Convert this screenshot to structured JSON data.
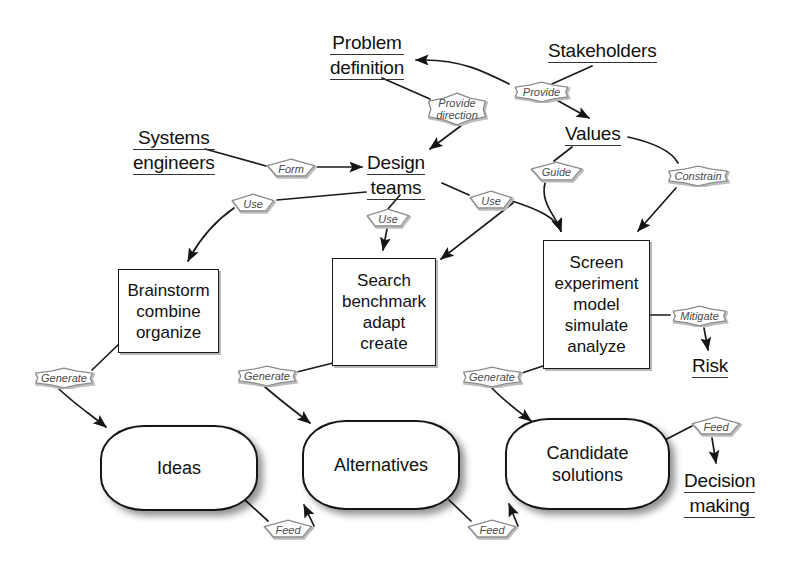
{
  "diagram": {
    "background": "#ffffff",
    "ink": "#111111",
    "cloud_text_color": "#4a4a4a"
  },
  "concepts": [
    {
      "id": "problem-definition",
      "lines": [
        "Problem",
        "definition"
      ],
      "x": 330,
      "y": 32
    },
    {
      "id": "stakeholders",
      "lines": [
        "Stakeholders"
      ],
      "x": 548,
      "y": 40
    },
    {
      "id": "values",
      "lines": [
        "Values"
      ],
      "x": 565,
      "y": 123
    },
    {
      "id": "systems-engineers",
      "lines": [
        "Systems",
        "engineers"
      ],
      "x": 133,
      "y": 127
    },
    {
      "id": "design-teams",
      "lines": [
        "Design",
        "teams"
      ],
      "x": 367,
      "y": 152
    },
    {
      "id": "risk",
      "lines": [
        "Risk"
      ],
      "x": 692,
      "y": 355
    },
    {
      "id": "decision-making",
      "lines": [
        "Decision",
        "making"
      ],
      "x": 684,
      "y": 470
    }
  ],
  "process_boxes": [
    {
      "id": "brainstorm",
      "lines": [
        "Brainstorm",
        "combine",
        "organize"
      ],
      "x": 118,
      "y": 269,
      "w": 101,
      "h": 84
    },
    {
      "id": "search",
      "lines": [
        "Search",
        "benchmark",
        "adapt",
        "create"
      ],
      "x": 332,
      "y": 258,
      "w": 104,
      "h": 108
    },
    {
      "id": "screen",
      "lines": [
        "Screen",
        "experiment",
        "model",
        "simulate",
        "analyze"
      ],
      "x": 543,
      "y": 240,
      "w": 107,
      "h": 129
    }
  ],
  "stores": [
    {
      "id": "ideas",
      "lines": [
        "Ideas"
      ],
      "x": 100,
      "y": 425,
      "w": 158,
      "h": 86
    },
    {
      "id": "alternatives",
      "lines": [
        "Alternatives"
      ],
      "x": 302,
      "y": 420,
      "w": 158,
      "h": 90
    },
    {
      "id": "candidate-solutions",
      "lines": [
        "Candidate",
        "solutions"
      ],
      "x": 505,
      "y": 418,
      "w": 165,
      "h": 92
    }
  ],
  "relations": [
    {
      "id": "provide",
      "lines": [
        "Provide"
      ],
      "x": 510,
      "y": 81,
      "w": 63,
      "h": 22
    },
    {
      "id": "provide-direction",
      "lines": [
        "Provide",
        "direction"
      ],
      "x": 423,
      "y": 92,
      "w": 68,
      "h": 34
    },
    {
      "id": "form",
      "lines": [
        "Form"
      ],
      "x": 265,
      "y": 158,
      "w": 52,
      "h": 21
    },
    {
      "id": "guide",
      "lines": [
        "Guide"
      ],
      "x": 529,
      "y": 161,
      "w": 55,
      "h": 22
    },
    {
      "id": "constrain",
      "lines": [
        "Constrain"
      ],
      "x": 663,
      "y": 165,
      "w": 70,
      "h": 22
    },
    {
      "id": "use-brainstorm",
      "lines": [
        "Use"
      ],
      "x": 230,
      "y": 193,
      "w": 46,
      "h": 21
    },
    {
      "id": "use-search",
      "lines": [
        "Use"
      ],
      "x": 365,
      "y": 208,
      "w": 46,
      "h": 21
    },
    {
      "id": "use-screen",
      "lines": [
        "Use"
      ],
      "x": 468,
      "y": 190,
      "w": 46,
      "h": 21
    },
    {
      "id": "mitigate",
      "lines": [
        "Mitigate"
      ],
      "x": 668,
      "y": 305,
      "w": 63,
      "h": 22
    },
    {
      "id": "generate-ideas",
      "lines": [
        "Generate"
      ],
      "x": 30,
      "y": 367,
      "w": 68,
      "h": 22
    },
    {
      "id": "generate-alternatives",
      "lines": [
        "Generate"
      ],
      "x": 233,
      "y": 365,
      "w": 68,
      "h": 22
    },
    {
      "id": "generate-candidates",
      "lines": [
        "Generate"
      ],
      "x": 458,
      "y": 366,
      "w": 68,
      "h": 22
    },
    {
      "id": "feed-alternatives",
      "lines": [
        "Feed"
      ],
      "x": 262,
      "y": 519,
      "w": 52,
      "h": 21
    },
    {
      "id": "feed-candidates",
      "lines": [
        "Feed"
      ],
      "x": 466,
      "y": 519,
      "w": 52,
      "h": 21
    },
    {
      "id": "feed-decision",
      "lines": [
        "Feed"
      ],
      "x": 690,
      "y": 416,
      "w": 52,
      "h": 21
    }
  ],
  "edges": [
    {
      "id": "stakeholders-provide",
      "from": "stakeholders",
      "to": "provide"
    },
    {
      "id": "provide-problem-definition",
      "from": "provide",
      "to": "problem-definition",
      "arrow": true
    },
    {
      "id": "provide-values",
      "from": "provide",
      "to": "values",
      "arrow": true
    },
    {
      "id": "problem-definition-direction",
      "from": "problem-definition",
      "to": "provide-direction"
    },
    {
      "id": "direction-design-teams",
      "from": "provide-direction",
      "to": "design-teams",
      "arrow": true
    },
    {
      "id": "systems-engineers-form",
      "from": "systems-engineers",
      "to": "form"
    },
    {
      "id": "form-design-teams",
      "from": "form",
      "to": "design-teams",
      "arrow": true
    },
    {
      "id": "design-teams-use-brainstorm",
      "from": "design-teams",
      "to": "use-brainstorm"
    },
    {
      "id": "use-brainstorm-box",
      "from": "use-brainstorm",
      "to": "brainstorm",
      "arrow": true
    },
    {
      "id": "design-teams-use-search",
      "from": "design-teams",
      "to": "use-search"
    },
    {
      "id": "use-search-box",
      "from": "use-search",
      "to": "search",
      "arrow": true
    },
    {
      "id": "design-teams-use-screen",
      "from": "design-teams",
      "to": "use-screen"
    },
    {
      "id": "use-screen-box",
      "from": "use-screen",
      "to": "screen",
      "arrow": true
    },
    {
      "id": "use-screen-search-box",
      "from": "use-screen",
      "to": "search",
      "arrow": true
    },
    {
      "id": "values-guide",
      "from": "values",
      "to": "guide"
    },
    {
      "id": "guide-screen",
      "from": "guide",
      "to": "screen",
      "arrow": true
    },
    {
      "id": "values-constrain",
      "from": "values",
      "to": "constrain"
    },
    {
      "id": "constrain-screen",
      "from": "constrain",
      "to": "screen",
      "arrow": true
    },
    {
      "id": "brainstorm-generate",
      "from": "brainstorm",
      "to": "generate-ideas"
    },
    {
      "id": "generate-ideas-store",
      "from": "generate-ideas",
      "to": "ideas",
      "arrow": true
    },
    {
      "id": "search-generate",
      "from": "search",
      "to": "generate-alternatives"
    },
    {
      "id": "generate-alternatives-store",
      "from": "generate-alternatives",
      "to": "alternatives",
      "arrow": true
    },
    {
      "id": "screen-generate",
      "from": "screen",
      "to": "generate-candidates"
    },
    {
      "id": "generate-candidates-store",
      "from": "generate-candidates",
      "to": "candidate-solutions",
      "arrow": true
    },
    {
      "id": "ideas-feed",
      "from": "ideas",
      "to": "feed-alternatives"
    },
    {
      "id": "feed-alternatives-store",
      "from": "feed-alternatives",
      "to": "alternatives",
      "arrow": true
    },
    {
      "id": "alternatives-feed",
      "from": "alternatives",
      "to": "feed-candidates"
    },
    {
      "id": "feed-candidates-store",
      "from": "feed-candidates",
      "to": "candidate-solutions",
      "arrow": true
    },
    {
      "id": "candidate-solutions-feed",
      "from": "candidate-solutions",
      "to": "feed-decision"
    },
    {
      "id": "feed-decision-making",
      "from": "feed-decision",
      "to": "decision-making",
      "arrow": true
    },
    {
      "id": "screen-mitigate",
      "from": "screen",
      "to": "mitigate"
    },
    {
      "id": "mitigate-risk",
      "from": "mitigate",
      "to": "risk",
      "arrow": true
    }
  ]
}
